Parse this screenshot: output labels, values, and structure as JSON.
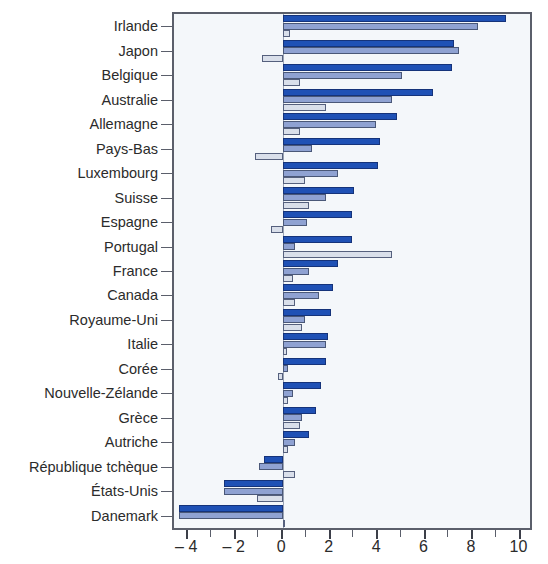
{
  "chart_data": {
    "type": "bar",
    "orientation": "horizontal",
    "title": "",
    "xlabel": "",
    "ylabel": "",
    "xlim": [
      -4.6,
      10.4
    ],
    "xticks": [
      -4,
      -2,
      0,
      2,
      4,
      6,
      8,
      10
    ],
    "xticklabels": [
      "– 4",
      "– 2",
      "0",
      "2",
      "4",
      "6",
      "8",
      "10"
    ],
    "xtick_minor_step": 1,
    "grid": false,
    "legend_position": "none",
    "zero_line": 0,
    "categories": [
      "Irlande",
      "Japon",
      "Belgique",
      "Australie",
      "Allemagne",
      "Pays-Bas",
      "Luxembourg",
      "Suisse",
      "Espagne",
      "Portugal",
      "France",
      "Canada",
      "Royaume-Uni",
      "Italie",
      "Corée",
      "Nouvelle-Zélande",
      "Grèce",
      "Autriche",
      "République tchèque",
      "États-Unis",
      "Danemark"
    ],
    "series": [
      {
        "name": "series-1",
        "color": "#1f51b5",
        "values": [
          9.4,
          7.2,
          7.1,
          6.3,
          4.8,
          4.1,
          4.0,
          3.0,
          2.9,
          2.9,
          2.3,
          2.1,
          2.0,
          1.9,
          1.8,
          1.6,
          1.4,
          1.1,
          -0.8,
          -2.5,
          -4.4
        ]
      },
      {
        "name": "series-2",
        "color": "#8fa2d2",
        "values": [
          8.2,
          7.4,
          5.0,
          4.6,
          3.9,
          1.2,
          2.3,
          1.8,
          1.0,
          0.5,
          1.1,
          1.5,
          0.9,
          1.8,
          0.2,
          0.4,
          0.8,
          0.5,
          -1.0,
          -2.5,
          -4.4
        ]
      },
      {
        "name": "series-3",
        "color": "#d9dfea",
        "values": [
          0.3,
          -0.9,
          0.7,
          1.8,
          0.7,
          -1.2,
          0.9,
          1.1,
          -0.5,
          4.6,
          0.4,
          0.5,
          0.8,
          0.15,
          -0.2,
          0.2,
          0.7,
          0.2,
          0.5,
          -1.1,
          0.05
        ]
      }
    ]
  },
  "axis": {
    "x_tick_values": [
      -4,
      -2,
      0,
      2,
      4,
      6,
      8,
      10
    ],
    "x_tick_labels": [
      "– 4",
      "– 2",
      "0",
      "2",
      "4",
      "6",
      "8",
      "10"
    ]
  },
  "colors": {
    "series1": "#1f51b5",
    "series2": "#8fa2d2",
    "series3": "#d9dfea",
    "frame": "#5b5f6b",
    "plot_background": "#f4f7fa",
    "text": "#2b2b2b"
  }
}
